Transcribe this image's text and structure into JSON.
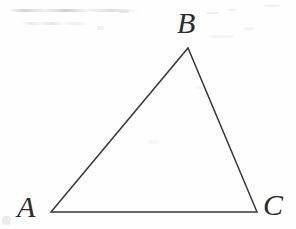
{
  "figure": {
    "shape_type": "triangle",
    "stroke_color": "#383838",
    "background_color": "#fefefe",
    "label_color": "#2b2b2b",
    "stroke_width": 1.5,
    "vertices": [
      {
        "name": "A",
        "label": "A",
        "x": 51,
        "y": 212,
        "label_x": 30,
        "label_y": 209,
        "position": "bottom-left"
      },
      {
        "name": "B",
        "label": "B",
        "x": 188,
        "y": 48,
        "label_x": 189,
        "label_y": 25,
        "position": "apex"
      },
      {
        "name": "C",
        "label": "C",
        "x": 257,
        "y": 212,
        "label_x": 277,
        "label_y": 208,
        "position": "bottom-right"
      }
    ],
    "edges": [
      {
        "name": "AB",
        "from": "A",
        "to": "B"
      },
      {
        "name": "BC",
        "from": "B",
        "to": "C"
      },
      {
        "name": "CA",
        "from": "C",
        "to": "A"
      }
    ],
    "polygon_points": "51,212 188,48 257,212"
  }
}
